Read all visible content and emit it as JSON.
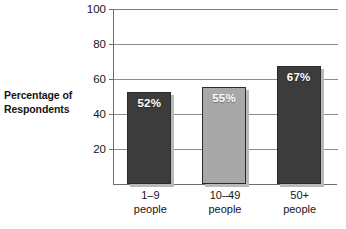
{
  "chart_data": {
    "type": "bar",
    "title": "",
    "subtitle": "",
    "xlabel": "",
    "ylabel": "Percentage of Respondents",
    "ylabel_lines": [
      "Percentage of",
      "Respondents"
    ],
    "categories": [
      "1–9 people",
      "10–49 people",
      "50+ people"
    ],
    "category_lines": [
      [
        "1–9",
        "people"
      ],
      [
        "10–49",
        "people"
      ],
      [
        "50+",
        "people"
      ]
    ],
    "values": [
      52,
      55,
      67
    ],
    "value_labels": [
      "52%",
      "55%",
      "67%"
    ],
    "ylim": [
      0,
      100
    ],
    "yticks": [
      20,
      40,
      60,
      80,
      100
    ],
    "ytick_labels": [
      "20",
      "40",
      "60",
      "80",
      "100"
    ],
    "grid": true,
    "grid_axis": "y",
    "legend": false,
    "legend_position": "none",
    "bar_colors": [
      "#3c3c3c",
      "#a8a8a8",
      "#3c3c3c"
    ],
    "value_label_color": "#ffffff",
    "axis_color": "#6e6e6e",
    "grid_color": "#8c8c8c",
    "background": "#ffffff"
  }
}
